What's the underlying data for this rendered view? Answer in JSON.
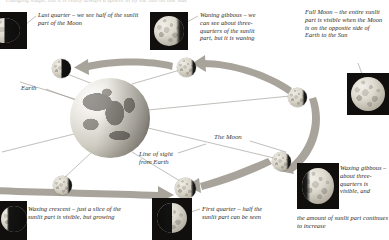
{
  "figure": {
    "clipped_header": "changing shape, but it is really always a sphere lit by the Sun on one side",
    "palette": {
      "page_background": "#ffffff",
      "text": "#2b2722",
      "leader_line": "#8d8880",
      "arrow": "#a9a49b",
      "thumbnail_background": "#100f0e",
      "moon_lit": "#e8e4da"
    }
  },
  "labels": {
    "earth": "Earth",
    "line_of_sight": "Line of sight\nfrom Earth",
    "the_moon": "The Moon"
  },
  "captions": {
    "last_quarter": "Last quarter – we see half of the sunlit part of the Moon",
    "waning_gibbous": "Waning gibbous – we can see about three-quarters of the sunlit part, but it is waning",
    "full_moon": "Full Moon – the entire sunlit part is visible when the Moon is on the opposite side of Earth to the Sun",
    "waxing_crescent": "Waxing crescent – just a slice of the sunlit part is visible, but growing",
    "first_quarter": "First quarter – half the sunlit part can be seen",
    "waxing_gibbous_lead": "Waxing gibbous – about three-quarters is visible, and",
    "waxing_gibbous_tail": "the amount of sunlit part continues to increase"
  },
  "phases": [
    {
      "id": "last-quarter",
      "name": "Last quarter",
      "illumination": "half",
      "shadow": "sh-right-half"
    },
    {
      "id": "waning-gibbous",
      "name": "Waning gibbous",
      "illumination": "three-quarters",
      "shadow": "sh-right-gibbous"
    },
    {
      "id": "full-moon",
      "name": "Full Moon",
      "illumination": "full",
      "shadow": "sh-none"
    },
    {
      "id": "waxing-gibbous",
      "name": "Waxing gibbous",
      "illumination": "three-quarters",
      "shadow": "sh-left-gibbous"
    },
    {
      "id": "first-quarter",
      "name": "First quarter",
      "illumination": "half",
      "shadow": "sh-left-half"
    },
    {
      "id": "waxing-crescent",
      "name": "Waxing crescent",
      "illumination": "crescent",
      "shadow": "sh-left-crescent"
    }
  ]
}
